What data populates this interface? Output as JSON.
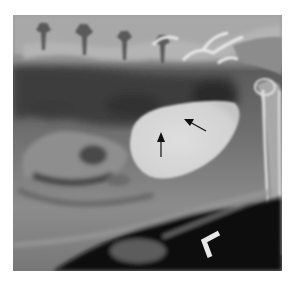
{
  "image": {
    "type": "radiograph",
    "view": "lateral abdominal radiograph",
    "description": "Lateral abdominal X-ray showing lumbar vertebrae along the top, gas-filled intestinal loops, a well-defined homogeneous opaque oval structure (urinary bladder) in mid-abdomen indicated by two black arrows, femur along the right side, and a positional marker in the lower right.",
    "marker_label": "L",
    "annotations": [
      {
        "type": "arrow",
        "direction": "up",
        "target": "bladder-dorsal-margin"
      },
      {
        "type": "arrow",
        "direction": "up-left",
        "target": "bladder-dorsal-margin"
      }
    ],
    "colors": {
      "background": "#ffffff",
      "soft_tissue": "#7a7a7a",
      "bladder": "#d8d8d8",
      "bone": "#e6e6e6",
      "gas": "#2a2a2a",
      "arrow": "#111111",
      "marker": "#e8e8e8"
    }
  }
}
